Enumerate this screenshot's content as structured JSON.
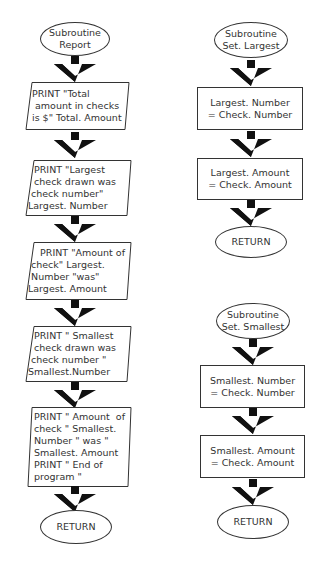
{
  "flowcharts": [
    {
      "name": "Subroutine Report",
      "start": "Subroutine\nReport",
      "steps": [
        "PRINT \"Total\n amount in checks\nis $\" Total. Amount",
        "  PRINT \"Largest\n  check drawn was\n check number\"\nLargest. Number",
        "    PRINT \"Amount of\n check\" Largest.\n Number \"was\"\nLargest. Amount",
        "  PRINT \" Smallest\n  check drawn was\n check number \"\nSmallest.Number",
        "PRINT \" Amount  of\ncheck \" Smallest.\nNumber \" was \"\nSmallest. Amount\nPRINT \" End of\nprogram \""
      ],
      "end": "RETURN"
    },
    {
      "name": "Subroutine Set. Largest",
      "start": "Subroutine\nSet. Largest",
      "steps": [
        "Largest. Number\n= Check. Number",
        "Largest. Amount\n= Check. Amount"
      ],
      "end": "RETURN"
    },
    {
      "name": "Subroutine Set. Smallest",
      "start": "Subroutine\nSet. Smallest",
      "steps": [
        "Smallest. Number\n= Check. Number",
        "Smallest. Amount\n= Check. Amount"
      ],
      "end": "RETURN"
    }
  ],
  "colors": {
    "line": "#333333",
    "arrow": "#111111",
    "background": "#ffffff"
  }
}
